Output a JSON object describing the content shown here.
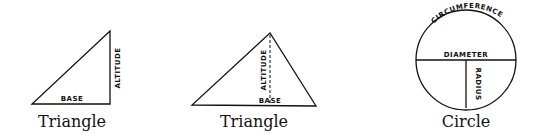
{
  "figures": [
    {
      "id": "right-triangle",
      "caption": "Triangle",
      "labels": {
        "base": "BASE",
        "altitude": "ALTITUDE"
      }
    },
    {
      "id": "scalene-triangle",
      "caption": "Triangle",
      "labels": {
        "base": "BASE",
        "altitude": "ALTITUDE"
      }
    },
    {
      "id": "circle",
      "caption": "Circle",
      "labels": {
        "circumference": "CIRCUMFERENCE",
        "diameter": "DIAMETER",
        "radius": "RADIUS"
      }
    }
  ],
  "colors": {
    "ink": "#111111",
    "background": "#ffffff"
  }
}
